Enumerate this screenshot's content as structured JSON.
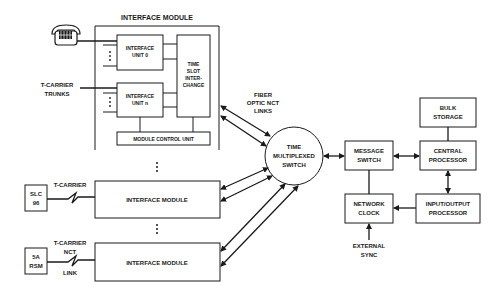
{
  "diagram": {
    "interface_module_top": {
      "title": "INTERFACE MODULE",
      "unit0": [
        "INTERFACE",
        "UNIT 0"
      ],
      "unitn": [
        "INTERFACE",
        "UNIT n"
      ],
      "tsi": [
        "TIME",
        "SLOT",
        "INTER-",
        "CHANGE"
      ],
      "mcu": "MODULE CONTROL UNIT"
    },
    "trunks_label": [
      "T-CARRIER",
      "TRUNKS"
    ],
    "fiber_label": [
      "FIBER",
      "OPTIC NCT",
      "LINKS"
    ],
    "tms": [
      "TIME",
      "MULTIPLEXED",
      "SWITCH"
    ],
    "message_switch": [
      "MESSAGE",
      "SWITCH"
    ],
    "central_processor": [
      "CENTRAL",
      "PROCESSOR"
    ],
    "bulk_storage": [
      "BULK",
      "STORAGE"
    ],
    "network_clock": [
      "NETWORK",
      "CLOCK"
    ],
    "io_processor": [
      "INPUT/OUTPUT",
      "PROCESSOR"
    ],
    "external_sync": [
      "EXTERNAL",
      "SYNC"
    ],
    "slc": [
      "SLC",
      "96"
    ],
    "slc_link": "T-CARRIER",
    "im_middle": "INTERFACE MODULE",
    "rsm": [
      "5A",
      "RSM"
    ],
    "rsm_link": [
      "T-CARRIER",
      "NCT",
      "LINK"
    ],
    "im_bottom": "INTERFACE MODULE",
    "icons": {
      "telephone": "telephone-icon"
    }
  }
}
